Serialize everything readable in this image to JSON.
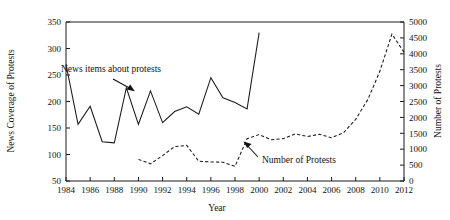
{
  "chart_data": {
    "type": "line",
    "title": "",
    "xlabel": "Year",
    "ylabel": "News Coverage of Protests",
    "y2label": "Number of Protests",
    "grid": false,
    "legend_position": "inline-annotations",
    "xlim": [
      1984,
      2012
    ],
    "xticks": [
      1984,
      1986,
      1988,
      1990,
      1992,
      1994,
      1996,
      1998,
      2000,
      2002,
      2004,
      2006,
      2008,
      2010,
      2012
    ],
    "xticklabels": [
      "1984",
      "1986",
      "1988",
      "1990",
      "1992",
      "1994",
      "1996",
      "1998",
      "2000",
      "2002",
      "2004",
      "2006",
      "2008",
      "2010",
      "2012"
    ],
    "ylim": [
      50,
      350
    ],
    "yticks": [
      50,
      100,
      150,
      200,
      250,
      300,
      350
    ],
    "yticklabels": [
      "50",
      "100",
      "150",
      "200",
      "250",
      "300",
      "350"
    ],
    "y2lim": [
      0,
      5000
    ],
    "y2ticks": [
      0,
      500,
      1000,
      1500,
      2000,
      2500,
      3000,
      3500,
      4000,
      4500,
      5000
    ],
    "y2ticklabels": [
      "0",
      "500",
      "1000",
      "1500",
      "2000",
      "2500",
      "3000",
      "3500",
      "4000",
      "4500",
      "5000"
    ],
    "series": [
      {
        "name": "News items about protests",
        "axis": "left",
        "style": "solid",
        "x": [
          1984,
          1985,
          1986,
          1987,
          1988,
          1989,
          1990,
          1991,
          1992,
          1993,
          1994,
          1995,
          1996,
          1997,
          1998,
          1999,
          2000
        ],
        "values": [
          270,
          157,
          191,
          124,
          122,
          226,
          157,
          220,
          160,
          181,
          190,
          176,
          245,
          207,
          198,
          186,
          330
        ]
      },
      {
        "name": "Number of Protests",
        "axis": "right",
        "style": "dashed",
        "x": [
          1990,
          1991,
          1992,
          1993,
          1994,
          1995,
          1996,
          1997,
          1998,
          1999,
          2000,
          2001,
          2002,
          2003,
          2004,
          2005,
          2006,
          2007,
          2008,
          2009,
          2010,
          2011,
          2012
        ],
        "values": [
          680,
          540,
          800,
          1080,
          1120,
          620,
          600,
          590,
          460,
          1330,
          1460,
          1300,
          1330,
          1480,
          1400,
          1470,
          1360,
          1520,
          1940,
          2560,
          3450,
          4620,
          4050
        ]
      }
    ],
    "annotations": [
      {
        "text": "News items about protests",
        "target_x": 1989,
        "target_y": 226
      },
      {
        "text": "Number of Protests",
        "target_x": 2004.6,
        "target_y2": 1400
      }
    ]
  }
}
